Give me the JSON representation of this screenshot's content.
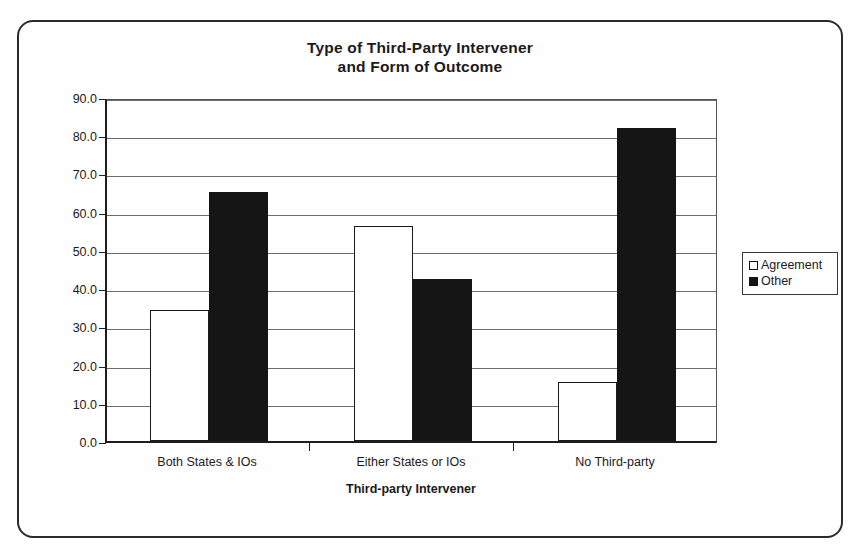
{
  "figure": {
    "frame": {
      "border_color": "#2b2b2b"
    },
    "title_lines": [
      "Type of Third-Party Intervener",
      "and Form of Outcome"
    ]
  },
  "axes": {
    "y_title": "Percentage of Crises",
    "x_title": "Third-party Intervener",
    "y_ticks": [
      "90.0",
      "80.0",
      "70.0",
      "60.0",
      "50.0",
      "40.0",
      "30.0",
      "20.0",
      "10.0",
      "0.0"
    ]
  },
  "legend": {
    "position": "right",
    "entries": [
      {
        "label": "Agreement",
        "swatch": "open-square-icon",
        "color": "#ffffff"
      },
      {
        "label": "Other",
        "swatch": "filled-square-icon",
        "color": "#141414"
      }
    ]
  },
  "chart_data": {
    "type": "bar",
    "title": "Type of Third-Party Intervener and Form of Outcome",
    "xlabel": "Third-party Intervener",
    "ylabel": "Percentage of Crises",
    "categories": [
      "Both States & IOs",
      "Either States or IOs",
      "No Third-party"
    ],
    "series": [
      {
        "name": "Agreement",
        "color": "#ffffff",
        "values": [
          34.2,
          56.2,
          15.5
        ]
      },
      {
        "name": "Other",
        "color": "#141414",
        "values": [
          65.2,
          42.5,
          82.0
        ]
      }
    ],
    "ylim": [
      0,
      90
    ],
    "ytick_step": 10,
    "grid": true,
    "legend_position": "right"
  }
}
